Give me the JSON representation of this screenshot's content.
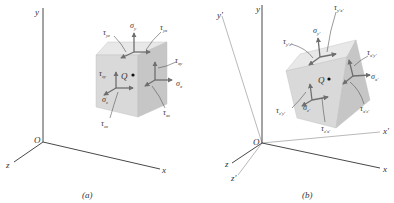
{
  "figure": {
    "panels": [
      {
        "id": "a",
        "caption": "(a)",
        "axes": {
          "x": "x",
          "y": "y",
          "z": "z",
          "origin": "O"
        },
        "point": "Q",
        "stresses": {
          "sigma_y": {
            "sym": "σ",
            "sub": "y"
          },
          "sigma_x": {
            "sym": "σ",
            "sub": "x"
          },
          "sigma_z": {
            "sym": "σ",
            "sub": "z"
          },
          "tau_yz": {
            "sym": "τ",
            "sub": "yz"
          },
          "tau_yx": {
            "sym": "τ",
            "sub": "yx"
          },
          "tau_xy": {
            "sym": "τ",
            "sub": "xy"
          },
          "tau_xz": {
            "sym": "τ",
            "sub": "xz"
          },
          "tau_zy": {
            "sym": "τ",
            "sub": "zy"
          },
          "tau_zx": {
            "sym": "τ",
            "sub": "zx"
          }
        }
      },
      {
        "id": "b",
        "caption": "(b)",
        "axes": {
          "x": "x",
          "y": "y",
          "z": "z",
          "xp": "x'",
          "yp": "y'",
          "zp": "z'",
          "origin": "O"
        },
        "point": "Q",
        "stresses": {
          "sigma_y": {
            "sym": "σ",
            "sub": "y'"
          },
          "sigma_x": {
            "sym": "σ",
            "sub": "x'"
          },
          "sigma_z": {
            "sym": "σ",
            "sub": "z'"
          },
          "tau_yz": {
            "sym": "τ",
            "sub": "y'z'"
          },
          "tau_yx": {
            "sym": "τ",
            "sub": "y'x'"
          },
          "tau_xy": {
            "sym": "τ",
            "sub": "x'y'"
          },
          "tau_xz": {
            "sym": "τ",
            "sub": "x'z'"
          },
          "tau_zy": {
            "sym": "τ",
            "sub": "z'y'"
          },
          "tau_zx": {
            "sym": "τ",
            "sub": "z'x'"
          }
        }
      }
    ],
    "colors": {
      "axis": "#333333",
      "axis_prime": "#8a8a8a",
      "cube_front": "#d9d9d9",
      "cube_top": "#e8e8e8",
      "cube_side": "#c4c4c4",
      "arrow": "#6e6e6e",
      "text": "#333333"
    }
  }
}
